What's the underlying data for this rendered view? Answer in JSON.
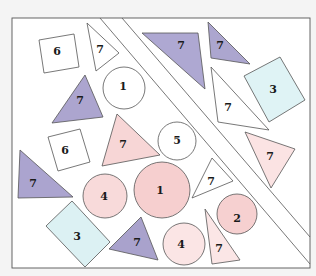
{
  "figure": {
    "colors": {
      "white": "#ffffff",
      "purple": "#a9a3cc",
      "pink": "#f6d3d3",
      "pink_light": "#fbe4e4",
      "cyan": "#dcf1f3",
      "frame": "#ffffff",
      "stroke": "#555555"
    },
    "shapes": [
      {
        "id": "square-6-top",
        "kind": "square",
        "label": "6",
        "fill": "white"
      },
      {
        "id": "triangle-7-top-white",
        "kind": "triangle",
        "label": "7",
        "fill": "white"
      },
      {
        "id": "circle-1-top",
        "kind": "circle",
        "label": "1",
        "fill": "white"
      },
      {
        "id": "triangle-7-purple-left",
        "kind": "triangle",
        "label": "7",
        "fill": "purple"
      },
      {
        "id": "square-6-mid",
        "kind": "square",
        "label": "6",
        "fill": "white"
      },
      {
        "id": "triangle-7-pink-center",
        "kind": "triangle",
        "label": "7",
        "fill": "pink"
      },
      {
        "id": "circle-5",
        "kind": "circle",
        "label": "5",
        "fill": "white"
      },
      {
        "id": "triangle-7-purple-edge",
        "kind": "triangle",
        "label": "7",
        "fill": "purple"
      },
      {
        "id": "circle-4-left",
        "kind": "circle",
        "label": "4",
        "fill": "pink"
      },
      {
        "id": "circle-1-big",
        "kind": "circle",
        "label": "1",
        "fill": "pink"
      },
      {
        "id": "triangle-7-white-center",
        "kind": "triangle",
        "label": "7",
        "fill": "white"
      },
      {
        "id": "circle-2",
        "kind": "circle",
        "label": "2",
        "fill": "pink"
      },
      {
        "id": "rect-3-bottom",
        "kind": "rectangle",
        "label": "3",
        "fill": "cyan"
      },
      {
        "id": "triangle-7-purple-bottom",
        "kind": "triangle",
        "label": "7",
        "fill": "purple"
      },
      {
        "id": "circle-4-bottom",
        "kind": "circle",
        "label": "4",
        "fill": "pink_light"
      },
      {
        "id": "triangle-7-pink-bottom",
        "kind": "triangle",
        "label": "7",
        "fill": "pink_light"
      },
      {
        "id": "triangle-7-purple-top",
        "kind": "triangle",
        "label": "7",
        "fill": "purple"
      },
      {
        "id": "triangle-7-purple-topright",
        "kind": "triangle",
        "label": "7",
        "fill": "purple"
      },
      {
        "id": "triangle-7-white-right",
        "kind": "triangle",
        "label": "7",
        "fill": "white"
      },
      {
        "id": "rect-3-right",
        "kind": "rectangle",
        "label": "3",
        "fill": "cyan"
      },
      {
        "id": "triangle-7-pink-right",
        "kind": "triangle",
        "label": "7",
        "fill": "pink_light"
      }
    ]
  }
}
